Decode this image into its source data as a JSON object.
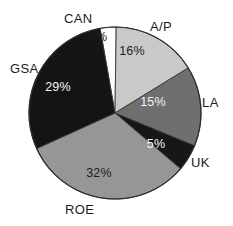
{
  "chart_data": {
    "type": "pie",
    "title": "",
    "subtitle": "",
    "xlabel": "",
    "ylabel": "",
    "legend_position": "none",
    "grid": false,
    "units": "percent",
    "total": 100,
    "start_angle_deg": -10,
    "direction": "clockwise",
    "categories": [
      "CAN",
      "A/P",
      "LA",
      "UK",
      "ROE",
      "GSA"
    ],
    "values": [
      3,
      16,
      15,
      5,
      32,
      29
    ],
    "value_labels": [
      "3%",
      "16%",
      "15%",
      "5%",
      "32%",
      "29%"
    ],
    "colors": [
      "#fdfdfd",
      "#c9c9c9",
      "#6f6f6f",
      "#171717",
      "#969696",
      "#141414"
    ],
    "slices": [
      {
        "name": "CAN",
        "label": "CAN",
        "value": 3,
        "value_label": "3%",
        "color": "#fdfdfd",
        "value_text_color": "#1c1c1c",
        "label_x": 64,
        "label_y": 12,
        "value_x": 98,
        "value_y": 38
      },
      {
        "name": "A/P",
        "label": "A/P",
        "value": 16,
        "value_label": "16%",
        "color": "#c9c9c9",
        "value_text_color": "#222222",
        "label_x": 150,
        "label_y": 20,
        "value_x": 132,
        "value_y": 52
      },
      {
        "name": "LA",
        "label": "LA",
        "value": 15,
        "value_label": "15%",
        "color": "#6f6f6f",
        "value_text_color": "#f2f2f2",
        "label_x": 202,
        "label_y": 96,
        "value_x": 153,
        "value_y": 103
      },
      {
        "name": "UK",
        "label": "UK",
        "value": 5,
        "value_label": "5%",
        "color": "#171717",
        "value_text_color": "#f4f4f4",
        "label_x": 191,
        "label_y": 156,
        "value_x": 156,
        "value_y": 145
      },
      {
        "name": "ROE",
        "label": "ROE",
        "value": 32,
        "value_label": "32%",
        "color": "#969696",
        "value_text_color": "#1d1d1d",
        "label_x": 65,
        "label_y": 203,
        "value_x": 99,
        "value_y": 174
      },
      {
        "name": "GSA",
        "label": "GSA",
        "value": 29,
        "value_label": "29%",
        "color": "#141414",
        "value_text_color": "#f4f4f4",
        "label_x": 10,
        "label_y": 62,
        "value_x": 58,
        "value_y": 88
      }
    ],
    "geometry": {
      "center_x": 115,
      "center_y": 113,
      "radius": 86
    }
  }
}
